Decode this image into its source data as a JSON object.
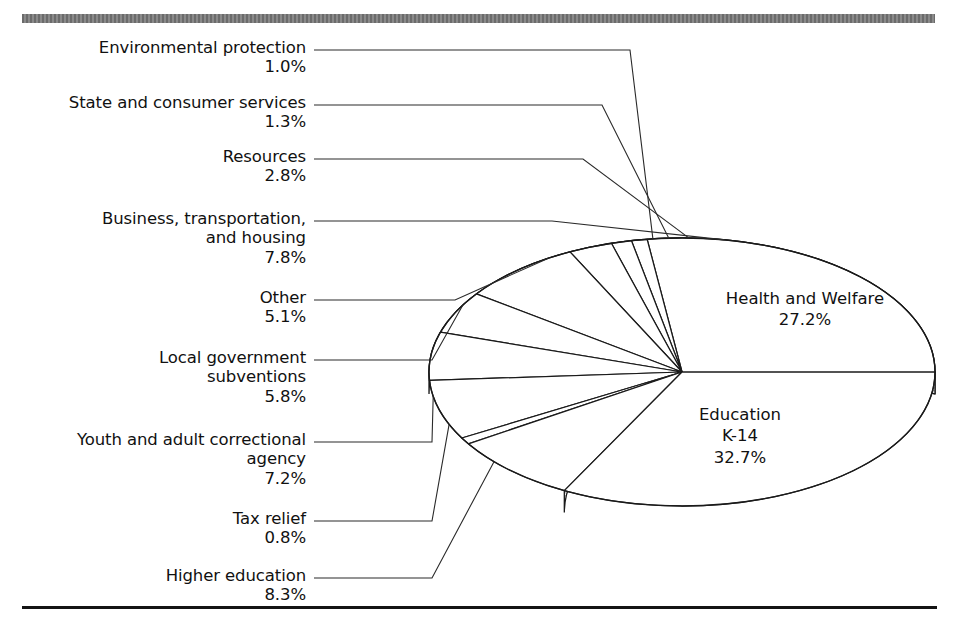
{
  "figure": {
    "top_rule_color": "#6f6f6f",
    "bottom_rule_color": "#141414",
    "background": "#ffffff",
    "pie_fill": "#ffffff",
    "pie_stroke": "#1a1a1a",
    "rim_shaded_color": "#b9b9b9",
    "rim_light_color": "#d8d8d8"
  },
  "chart_data": {
    "type": "pie",
    "title": "",
    "units": "percent",
    "legend_position": "callouts",
    "grid": false,
    "categories": [
      "Health and Welfare",
      "Education K-14",
      "Higher education",
      "Tax relief",
      "Youth and adult correctional agency",
      "Local government subventions",
      "Other",
      "Business, transportation, and housing",
      "Resources",
      "State and consumer services",
      "Environmental protection"
    ],
    "values": [
      27.2,
      32.7,
      8.3,
      0.8,
      7.2,
      5.8,
      5.1,
      7.8,
      2.8,
      1.3,
      1.0
    ],
    "labels": [
      "27.2%",
      "32.7%",
      "8.3%",
      "0.8%",
      "7.2%",
      "5.8%",
      "5.1%",
      "7.8%",
      "2.8%",
      "1.3%",
      "1.0%"
    ]
  },
  "inpie_labels": [
    {
      "name": "health-and-welfare",
      "line1": "Health and Welfare",
      "line2": "27.2%",
      "line3": ""
    },
    {
      "name": "education-k14",
      "line1": "Education",
      "line2": "K-14",
      "line3": "32.7%"
    }
  ],
  "callouts": [
    {
      "name": "environmental-protection",
      "label": "Environmental protection",
      "pct": "1.0%"
    },
    {
      "name": "state-and-consumer-services",
      "label": "State and consumer services",
      "pct": "1.3%"
    },
    {
      "name": "resources",
      "label": "Resources",
      "pct": "2.8%"
    },
    {
      "name": "business-transportation-and-housing",
      "label": "Business, transportation,\nand housing",
      "pct": "7.8%"
    },
    {
      "name": "other",
      "label": "Other",
      "pct": "5.1%"
    },
    {
      "name": "local-government-subventions",
      "label": "Local government\nsubventions",
      "pct": "5.8%"
    },
    {
      "name": "youth-and-adult-correctional-agency",
      "label": "Youth and adult correctional\nagency",
      "pct": "7.2%"
    },
    {
      "name": "tax-relief",
      "label": "Tax relief",
      "pct": "0.8%"
    },
    {
      "name": "higher-education",
      "label": "Higher education",
      "pct": "8.3%"
    }
  ]
}
